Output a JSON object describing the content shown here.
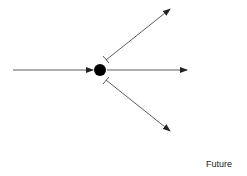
{
  "diagram": {
    "caption": "Future",
    "colors": {
      "line": "#333333",
      "node": "#000000",
      "background": "#ffffff"
    },
    "node": {
      "cx": 100,
      "cy": 70,
      "r": 6
    },
    "edges": [
      {
        "id": "incoming",
        "x1": 13,
        "y1": 70,
        "x2": 93,
        "y2": 70,
        "head": "arrow"
      },
      {
        "id": "straight",
        "x1": 107,
        "y1": 70,
        "x2": 187,
        "y2": 70,
        "head": "arrow"
      },
      {
        "id": "upper-branch",
        "x1": 106,
        "y1": 60,
        "x2": 170,
        "y2": 9,
        "head": "arrow",
        "tail": "bar"
      },
      {
        "id": "lower-branch",
        "x1": 106,
        "y1": 80,
        "x2": 170,
        "y2": 131,
        "head": "arrow",
        "tail": "bar"
      }
    ]
  }
}
